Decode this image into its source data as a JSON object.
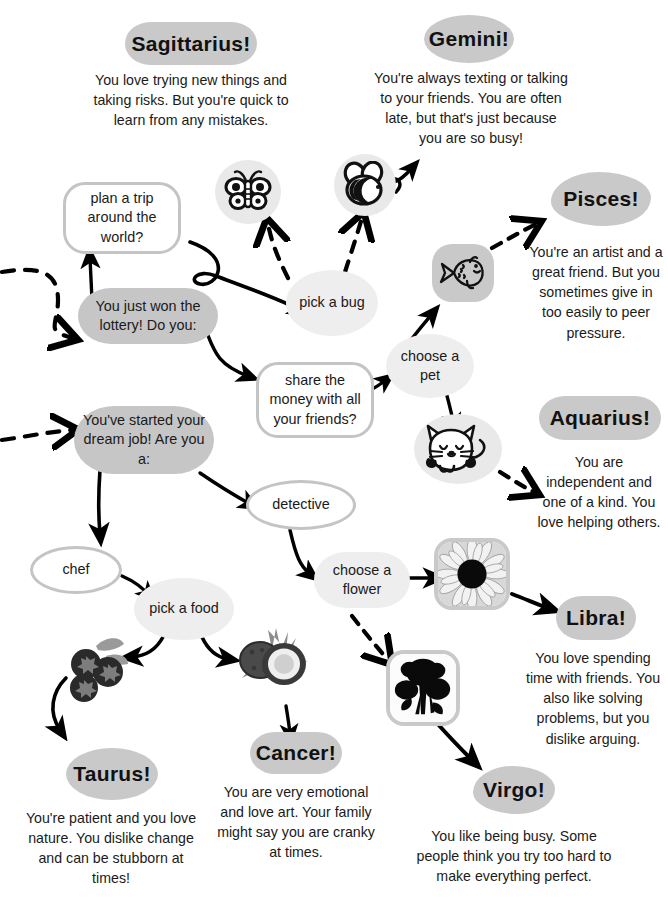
{
  "palette": {
    "blob_gray": "#c9c9c9",
    "light_gray": "#eeeeee",
    "outline_gray": "#c4c4c4",
    "text_black": "#1a1a1a",
    "arrow_black": "#000000"
  },
  "zodiac": [
    {
      "id": "sagittarius",
      "label": "Sagittarius!",
      "shape": "rounded",
      "description": "You love trying new things and taking risks. But you're quick to learn from any mistakes."
    },
    {
      "id": "gemini",
      "label": "Gemini!",
      "shape": "ellipse",
      "description": "You're always texting or talking to your friends. You are often late, but that's just because you are so busy!"
    },
    {
      "id": "pisces",
      "label": "Pisces!",
      "shape": "cloud",
      "description": "You're an artist and a great friend. But you sometimes give in too easily to peer pressure."
    },
    {
      "id": "aquarius",
      "label": "Aquarius!",
      "shape": "rounded",
      "description": "You are independent and one of a kind. You love helping others."
    },
    {
      "id": "libra",
      "label": "Libra!",
      "shape": "rounded",
      "description": "You love spending time with friends. You also like solving problems, but you dislike arguing."
    },
    {
      "id": "virgo",
      "label": "Virgo!",
      "shape": "cloud",
      "description": "You like being busy. Some people think you try too hard to make everything perfect."
    },
    {
      "id": "cancer",
      "label": "Cancer!",
      "shape": "rounded",
      "description": "You are very emotional and love art. Your family might say you are cranky at times."
    },
    {
      "id": "taurus",
      "label": "Taurus!",
      "shape": "ellipse",
      "description": "You're patient and you love nature. You dislike change and can be stubborn at times!"
    }
  ],
  "nodes": [
    {
      "id": "plan-trip",
      "text": "plan a trip around the world?",
      "style": "outline-round"
    },
    {
      "id": "won-lottery",
      "text": "You just won the lottery! Do you:",
      "style": "solid-blob"
    },
    {
      "id": "pick-a-bug",
      "text": "pick a bug",
      "style": "light-blob"
    },
    {
      "id": "choose-a-pet",
      "text": "choose a pet",
      "style": "light-blob"
    },
    {
      "id": "share-money",
      "text": "share the money with all your friends?",
      "style": "outline-round"
    },
    {
      "id": "dream-job",
      "text": "You've started your dream job! Are you a:",
      "style": "solid-blob"
    },
    {
      "id": "detective",
      "text": "detective",
      "style": "outline-ellipse"
    },
    {
      "id": "chef",
      "text": "chef",
      "style": "outline-ellipse"
    },
    {
      "id": "pick-a-food",
      "text": "pick a food",
      "style": "light-blob"
    },
    {
      "id": "choose-flower",
      "text": "choose a flower",
      "style": "light-round"
    }
  ],
  "icons": [
    {
      "id": "butterfly",
      "name": "butterfly-icon",
      "tile": "circle"
    },
    {
      "id": "bee",
      "name": "bee-icon",
      "tile": "circle"
    },
    {
      "id": "fish",
      "name": "fish-icon",
      "tile": "sqround"
    },
    {
      "id": "cat",
      "name": "cat-icon",
      "tile": "circle"
    },
    {
      "id": "sunflower",
      "name": "sunflower-photo",
      "tile": "photo"
    },
    {
      "id": "roses",
      "name": "roses-photo",
      "tile": "photo"
    },
    {
      "id": "berries",
      "name": "berries-photo",
      "tile": "plain"
    },
    {
      "id": "coconut",
      "name": "coconut-photo",
      "tile": "plain"
    }
  ]
}
